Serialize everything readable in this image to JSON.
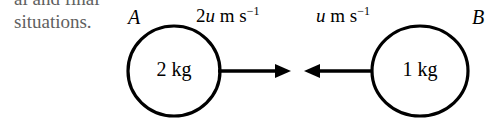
{
  "figure": {
    "kind": "physics-collision-diagram",
    "background_color": "#ffffff",
    "stroke_color": "#000000",
    "body_text_color": "#5f5f5f"
  },
  "body_text": {
    "line1": "al and final",
    "line2": "situations."
  },
  "diagram": {
    "bodies": [
      {
        "name": "A",
        "label": "A",
        "mass_text": "2 kg",
        "cx": 174,
        "cy": 71,
        "rx": 46,
        "ry": 45
      },
      {
        "name": "B",
        "label": "B",
        "mass_text": "1 kg",
        "cx": 420,
        "cy": 71,
        "rx": 48,
        "ry": 45
      }
    ],
    "velocity_labels": {
      "left": {
        "coefficient": "2",
        "symbol": "u",
        "unit": " m s",
        "exponent": "−1",
        "full": "2u m s−1"
      },
      "right": {
        "coefficient": "",
        "symbol": "u",
        "unit": " m s",
        "exponent": "−1",
        "full": "u m s−1"
      }
    },
    "arrows": [
      {
        "name": "arrow-a-right",
        "direction": "right",
        "x_start": 218,
        "x_end": 291,
        "y": 71
      },
      {
        "name": "arrow-b-left",
        "direction": "left",
        "x_start": 371,
        "x_end": 304,
        "y": 71
      }
    ]
  }
}
